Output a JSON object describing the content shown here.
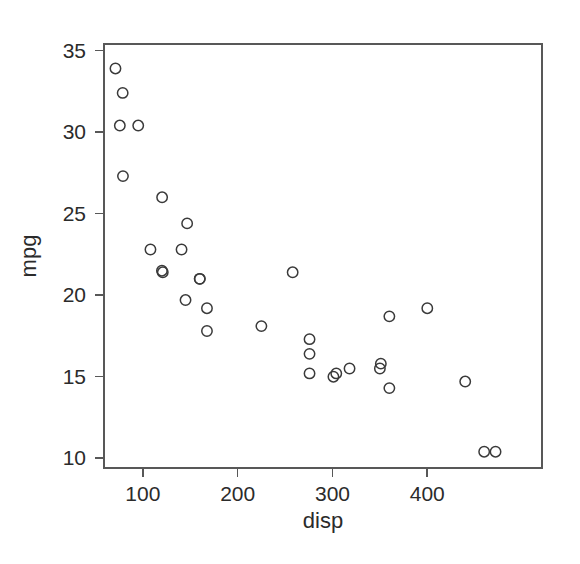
{
  "chart_data": {
    "type": "scatter",
    "title": "",
    "xlabel": "disp",
    "ylabel": "mpg",
    "xlim": [
      59,
      521
    ],
    "ylim": [
      9.4,
      35.4
    ],
    "xticks": [
      100,
      200,
      300,
      400
    ],
    "xtick_labels": [
      "100",
      "200",
      "300",
      "400"
    ],
    "yticks": [
      10,
      15,
      20,
      25,
      30,
      35
    ],
    "ytick_labels": [
      "10",
      "15",
      "20",
      "25",
      "30",
      "35"
    ],
    "grid": false,
    "legend": "none",
    "marker": "open-circle",
    "marker_color": "#3a3a3a",
    "point_count": 32,
    "x": [
      160,
      160,
      108,
      258,
      360,
      225,
      360,
      146.7,
      140.8,
      167.6,
      167.6,
      275.8,
      275.8,
      275.8,
      472,
      460,
      440,
      78.7,
      75.7,
      71.1,
      120.1,
      318,
      304,
      350,
      400,
      79,
      120.3,
      95.1,
      351,
      145,
      301,
      121
    ],
    "y": [
      21.0,
      21.0,
      22.8,
      21.4,
      18.7,
      18.1,
      14.3,
      24.4,
      22.8,
      19.2,
      17.8,
      16.4,
      17.3,
      15.2,
      10.4,
      10.4,
      14.7,
      32.4,
      30.4,
      33.9,
      21.5,
      15.5,
      15.2,
      15.5,
      19.2,
      27.3,
      26.0,
      30.4,
      15.8,
      19.7,
      15.0,
      21.4
    ],
    "points": [
      {
        "x": 160,
        "y": 21.0
      },
      {
        "x": 160,
        "y": 21.0
      },
      {
        "x": 108,
        "y": 22.8
      },
      {
        "x": 258,
        "y": 21.4
      },
      {
        "x": 360,
        "y": 18.7
      },
      {
        "x": 225,
        "y": 18.1
      },
      {
        "x": 360,
        "y": 14.3
      },
      {
        "x": 146.7,
        "y": 24.4
      },
      {
        "x": 140.8,
        "y": 22.8
      },
      {
        "x": 167.6,
        "y": 19.2
      },
      {
        "x": 167.6,
        "y": 17.8
      },
      {
        "x": 275.8,
        "y": 16.4
      },
      {
        "x": 275.8,
        "y": 17.3
      },
      {
        "x": 275.8,
        "y": 15.2
      },
      {
        "x": 472,
        "y": 10.4
      },
      {
        "x": 460,
        "y": 10.4
      },
      {
        "x": 440,
        "y": 14.7
      },
      {
        "x": 78.7,
        "y": 32.4
      },
      {
        "x": 75.7,
        "y": 30.4
      },
      {
        "x": 71.1,
        "y": 33.9
      },
      {
        "x": 120.1,
        "y": 21.5
      },
      {
        "x": 318,
        "y": 15.5
      },
      {
        "x": 304,
        "y": 15.2
      },
      {
        "x": 350,
        "y": 15.5
      },
      {
        "x": 400,
        "y": 19.2
      },
      {
        "x": 79,
        "y": 27.3
      },
      {
        "x": 120.3,
        "y": 26.0
      },
      {
        "x": 95.1,
        "y": 30.4
      },
      {
        "x": 351,
        "y": 15.8
      },
      {
        "x": 145,
        "y": 19.7
      },
      {
        "x": 301,
        "y": 15.0
      },
      {
        "x": 121,
        "y": 21.4
      }
    ]
  },
  "layout": {
    "plot_box": {
      "left": 104,
      "top": 44,
      "right": 542,
      "bottom": 468
    },
    "marker_radius": 5.2,
    "axis_color": "#585858",
    "marker_color": "#3a3a3a",
    "background": "#ffffff"
  }
}
